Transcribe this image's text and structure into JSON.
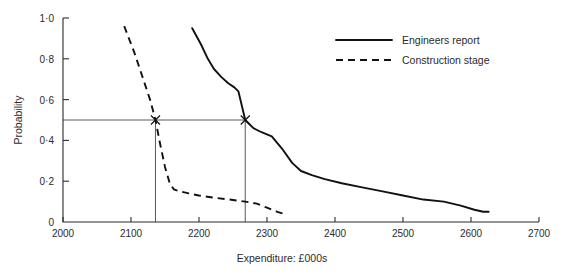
{
  "chart_data": {
    "type": "line",
    "title": "",
    "xlabel": "Expenditure: £000s",
    "ylabel": "Probability",
    "xlim": [
      2000,
      2700
    ],
    "ylim": [
      0,
      1.0
    ],
    "grid": false,
    "legend_position": "top-right",
    "x_ticks": [
      2000,
      2100,
      2200,
      2300,
      2400,
      2500,
      2600,
      2700
    ],
    "x_tick_labels": [
      "2000",
      "2100",
      "2200",
      "2300",
      "2400",
      "2500",
      "2600",
      "2700"
    ],
    "y_ticks": [
      0,
      0.2,
      0.4,
      0.6,
      0.8,
      1.0
    ],
    "y_tick_labels": [
      "0",
      "0·2",
      "0·4",
      "0·6",
      "0·8",
      "1·0"
    ],
    "series": [
      {
        "name": "Engineers report",
        "style": "solid",
        "points": [
          [
            2190,
            0.95
          ],
          [
            2203,
            0.87
          ],
          [
            2213,
            0.8
          ],
          [
            2222,
            0.75
          ],
          [
            2233,
            0.71
          ],
          [
            2243,
            0.68
          ],
          [
            2252,
            0.66
          ],
          [
            2258,
            0.64
          ],
          [
            2268,
            0.5
          ],
          [
            2280,
            0.46
          ],
          [
            2292,
            0.44
          ],
          [
            2307,
            0.42
          ],
          [
            2322,
            0.36
          ],
          [
            2337,
            0.29
          ],
          [
            2350,
            0.25
          ],
          [
            2366,
            0.23
          ],
          [
            2385,
            0.21
          ],
          [
            2410,
            0.19
          ],
          [
            2440,
            0.17
          ],
          [
            2470,
            0.15
          ],
          [
            2500,
            0.13
          ],
          [
            2530,
            0.11
          ],
          [
            2560,
            0.1
          ],
          [
            2585,
            0.08
          ],
          [
            2605,
            0.06
          ],
          [
            2618,
            0.05
          ],
          [
            2626,
            0.05
          ]
        ]
      },
      {
        "name": "Construction stage",
        "style": "dashed",
        "points": [
          [
            2090,
            0.96
          ],
          [
            2105,
            0.83
          ],
          [
            2118,
            0.7
          ],
          [
            2128,
            0.6
          ],
          [
            2136,
            0.5
          ],
          [
            2143,
            0.38
          ],
          [
            2150,
            0.27
          ],
          [
            2157,
            0.19
          ],
          [
            2163,
            0.16
          ],
          [
            2172,
            0.15
          ],
          [
            2185,
            0.14
          ],
          [
            2200,
            0.13
          ],
          [
            2220,
            0.12
          ],
          [
            2245,
            0.11
          ],
          [
            2268,
            0.1
          ],
          [
            2285,
            0.09
          ],
          [
            2300,
            0.07
          ],
          [
            2315,
            0.05
          ],
          [
            2325,
            0.04
          ]
        ]
      }
    ],
    "reference_lines": {
      "horizontal_probability": 0.5,
      "vertical_expenditures": [
        2136,
        2268
      ]
    },
    "markers": [
      {
        "x": 2136,
        "y": 0.5,
        "symbol": "x",
        "series": "Construction stage"
      },
      {
        "x": 2268,
        "y": 0.5,
        "symbol": "x",
        "series": "Engineers report"
      }
    ]
  },
  "legend": {
    "entries": [
      {
        "label": "Engineers report",
        "style": "solid"
      },
      {
        "label": "Construction stage",
        "style": "dashed"
      }
    ]
  }
}
